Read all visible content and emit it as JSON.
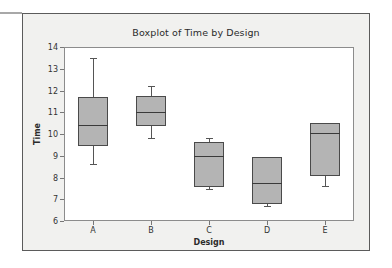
{
  "chart_data": {
    "type": "box",
    "title": "Boxplot of Time by Design",
    "xlabel": "Design",
    "ylabel": "Time",
    "categories": [
      "A",
      "B",
      "C",
      "D",
      "E"
    ],
    "ylim": [
      6,
      14
    ],
    "y_ticks": [
      6,
      7,
      8,
      9,
      10,
      11,
      12,
      13,
      14
    ],
    "grid": false,
    "legend": null,
    "boxes": [
      {
        "category": "A",
        "min": 8.6,
        "q1": 9.45,
        "median": 10.4,
        "q3": 11.7,
        "max": 13.5
      },
      {
        "category": "B",
        "min": 9.8,
        "q1": 10.35,
        "median": 11.0,
        "q3": 11.75,
        "max": 12.2
      },
      {
        "category": "C",
        "min": 7.45,
        "q1": 7.55,
        "median": 9.0,
        "q3": 9.65,
        "max": 9.8
      },
      {
        "category": "D",
        "min": 6.7,
        "q1": 6.8,
        "median": 7.75,
        "q3": 8.95,
        "max": 8.95
      },
      {
        "category": "E",
        "min": 7.6,
        "q1": 8.05,
        "median": 10.05,
        "q3": 10.5,
        "max": 10.5
      }
    ],
    "colors": {
      "box_fill": "#b4b4b4",
      "box_border": "#4a4a4a",
      "median": "#3a3a3a",
      "whisker": "#555555",
      "plot_background": "#ffffff",
      "frame_background": "#f1f1ef",
      "axis": "#8c8c8c"
    }
  }
}
